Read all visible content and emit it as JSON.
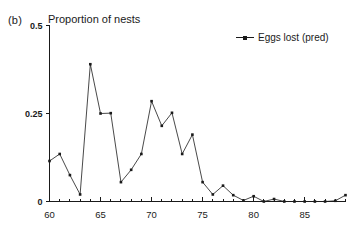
{
  "panel": {
    "label": "(b)"
  },
  "legend": {
    "position": "top-right",
    "entries": [
      {
        "label": "Eggs lost (pred)",
        "marker": "line-with-square-marker",
        "color": "#1a1a1a"
      }
    ]
  },
  "colors": {
    "series": "#1a1a1a",
    "axis": "#1a1a1a",
    "background": "#ffffff"
  },
  "chart_data": {
    "type": "line",
    "title": "Proportion of nests",
    "xlabel": "",
    "ylabel": "",
    "xlim": [
      60,
      89
    ],
    "ylim": [
      0,
      0.5
    ],
    "grid": false,
    "legend_position": "top-right",
    "yticks": [
      0,
      0.25,
      0.5
    ],
    "ytick_labels": [
      "0",
      "0.25",
      "0.5"
    ],
    "xticks": [
      60,
      65,
      70,
      75,
      80,
      85
    ],
    "xtick_labels": [
      "60",
      "65",
      "70",
      "75",
      "80",
      "85"
    ],
    "xtick_minor_step": 1,
    "x": [
      60,
      61,
      62,
      63,
      64,
      65,
      66,
      67,
      68,
      69,
      70,
      71,
      72,
      73,
      74,
      75,
      76,
      77,
      78,
      79,
      80,
      81,
      82,
      83,
      84,
      85,
      86,
      87,
      88,
      89
    ],
    "series": [
      {
        "name": "Eggs lost (pred)",
        "values": [
          0.115,
          0.135,
          0.075,
          0.02,
          0.39,
          0.25,
          0.251,
          0.055,
          0.09,
          0.135,
          0.285,
          0.215,
          0.252,
          0.135,
          0.19,
          0.055,
          0.02,
          0.045,
          0.018,
          0.003,
          0.015,
          0.0,
          0.007,
          0.0,
          0.0,
          0.0,
          0.0,
          0.0,
          0.002,
          0.018
        ]
      }
    ]
  }
}
